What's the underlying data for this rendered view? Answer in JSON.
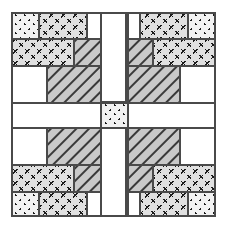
{
  "figure": {
    "width": 227,
    "height": 229,
    "background_color": "#ffffff",
    "outline_color": "#4a4a4a",
    "block_origin_x": 12,
    "block_origin_y": 13,
    "block_size": 203,
    "symmetry": "4-way mirror (horizontal and vertical)"
  },
  "fabrics": {
    "white": {
      "name": "plain-white",
      "fill": "#ffffff",
      "motif": "none"
    },
    "dotted": {
      "name": "dotted-print",
      "fill": "#f2f2f2",
      "motif": "dots",
      "motif_color": "#1a1a1a"
    },
    "xprint": {
      "name": "x-print",
      "fill": "#e0e0e0",
      "motif": "x-marks",
      "motif_color": "#1a1a1a"
    },
    "hatch": {
      "name": "diagonal-hatch",
      "fill": "#c9c9c9",
      "motif": "diagonal-lines",
      "motif_color": "#3a3a3a"
    }
  },
  "patches": [
    {
      "name": "patch-tl-corner-dotted",
      "fabric": "dotted",
      "x": 12,
      "y": 13,
      "w": 27,
      "h": 26
    },
    {
      "name": "patch-tl-top-xprint",
      "fabric": "xprint",
      "x": 39,
      "y": 13,
      "w": 48,
      "h": 26
    },
    {
      "name": "patch-tl-top-white",
      "fabric": "white",
      "x": 87,
      "y": 13,
      "w": 14,
      "h": 26
    },
    {
      "name": "patch-tl-band-xprint",
      "fabric": "xprint",
      "x": 12,
      "y": 39,
      "w": 62,
      "h": 27
    },
    {
      "name": "patch-tl-band-hatch",
      "fabric": "hatch",
      "x": 74,
      "y": 39,
      "w": 27,
      "h": 27
    },
    {
      "name": "patch-tl-left-white",
      "fabric": "white",
      "x": 12,
      "y": 66,
      "w": 35,
      "h": 37
    },
    {
      "name": "patch-tl-inner-hatch",
      "fabric": "hatch",
      "x": 47,
      "y": 66,
      "w": 54,
      "h": 37
    },
    {
      "name": "patch-sash-top-white",
      "fabric": "white",
      "x": 101,
      "y": 13,
      "w": 27,
      "h": 89
    },
    {
      "name": "patch-tr-corner-dotted",
      "fabric": "dotted",
      "x": 188,
      "y": 13,
      "w": 27,
      "h": 26
    },
    {
      "name": "patch-tr-top-xprint",
      "fabric": "xprint",
      "x": 140,
      "y": 13,
      "w": 48,
      "h": 26
    },
    {
      "name": "patch-tr-top-white",
      "fabric": "white",
      "x": 126,
      "y": 13,
      "w": 14,
      "h": 26
    },
    {
      "name": "patch-tr-band-xprint",
      "fabric": "xprint",
      "x": 153,
      "y": 39,
      "w": 62,
      "h": 27
    },
    {
      "name": "patch-tr-band-hatch",
      "fabric": "hatch",
      "x": 126,
      "y": 39,
      "w": 27,
      "h": 27
    },
    {
      "name": "patch-tr-right-white",
      "fabric": "white",
      "x": 180,
      "y": 66,
      "w": 35,
      "h": 37
    },
    {
      "name": "patch-tr-inner-hatch",
      "fabric": "hatch",
      "x": 126,
      "y": 66,
      "w": 54,
      "h": 37
    },
    {
      "name": "patch-sash-left-white",
      "fabric": "white",
      "x": 12,
      "y": 103,
      "w": 89,
      "h": 25
    },
    {
      "name": "patch-center-dotted",
      "fabric": "dotted",
      "x": 101,
      "y": 103,
      "w": 27,
      "h": 25
    },
    {
      "name": "patch-sash-right-white",
      "fabric": "white",
      "x": 128,
      "y": 103,
      "w": 87,
      "h": 25
    },
    {
      "name": "patch-bl-inner-hatch",
      "fabric": "hatch",
      "x": 47,
      "y": 128,
      "w": 54,
      "h": 37
    },
    {
      "name": "patch-bl-left-white",
      "fabric": "white",
      "x": 12,
      "y": 128,
      "w": 35,
      "h": 37
    },
    {
      "name": "patch-bl-band-xprint",
      "fabric": "xprint",
      "x": 12,
      "y": 165,
      "w": 62,
      "h": 27
    },
    {
      "name": "patch-bl-band-hatch",
      "fabric": "hatch",
      "x": 74,
      "y": 165,
      "w": 27,
      "h": 27
    },
    {
      "name": "patch-bl-corner-dotted",
      "fabric": "dotted",
      "x": 12,
      "y": 192,
      "w": 27,
      "h": 24
    },
    {
      "name": "patch-bl-bottom-xprint",
      "fabric": "xprint",
      "x": 39,
      "y": 192,
      "w": 48,
      "h": 24
    },
    {
      "name": "patch-bl-bottom-white",
      "fabric": "white",
      "x": 87,
      "y": 192,
      "w": 14,
      "h": 24
    },
    {
      "name": "patch-sash-bottom-white",
      "fabric": "white",
      "x": 101,
      "y": 128,
      "w": 27,
      "h": 88
    },
    {
      "name": "patch-br-inner-hatch",
      "fabric": "hatch",
      "x": 126,
      "y": 128,
      "w": 54,
      "h": 37
    },
    {
      "name": "patch-br-right-white",
      "fabric": "white",
      "x": 180,
      "y": 128,
      "w": 35,
      "h": 37
    },
    {
      "name": "patch-br-band-xprint",
      "fabric": "xprint",
      "x": 153,
      "y": 165,
      "w": 62,
      "h": 27
    },
    {
      "name": "patch-br-band-hatch",
      "fabric": "hatch",
      "x": 126,
      "y": 165,
      "w": 27,
      "h": 27
    },
    {
      "name": "patch-br-corner-dotted",
      "fabric": "dotted",
      "x": 188,
      "y": 192,
      "w": 27,
      "h": 24
    },
    {
      "name": "patch-br-bottom-xprint",
      "fabric": "xprint",
      "x": 140,
      "y": 192,
      "w": 48,
      "h": 24
    },
    {
      "name": "patch-br-bottom-white",
      "fabric": "white",
      "x": 126,
      "y": 192,
      "w": 14,
      "h": 24
    }
  ],
  "seam_lines": [
    {
      "name": "seam-outer-border",
      "x1": 12,
      "y1": 13,
      "x2": 215,
      "y2": 216,
      "kind": "rect"
    },
    {
      "name": "seam-sash-v-left",
      "x1": 101,
      "y1": 13,
      "x2": 101,
      "y2": 216,
      "kind": "line"
    },
    {
      "name": "seam-sash-v-right",
      "x1": 128,
      "y1": 13,
      "x2": 128,
      "y2": 216,
      "kind": "line"
    },
    {
      "name": "seam-sash-h-top",
      "x1": 12,
      "y1": 103,
      "x2": 215,
      "y2": 103,
      "kind": "line"
    },
    {
      "name": "seam-sash-h-bot",
      "x1": 12,
      "y1": 128,
      "x2": 215,
      "y2": 128,
      "kind": "line"
    }
  ]
}
